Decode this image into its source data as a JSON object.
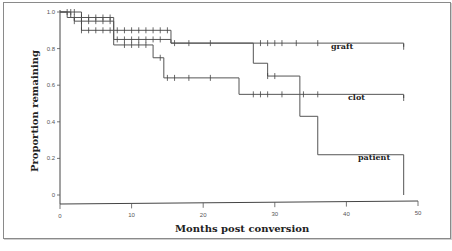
{
  "chart_data": {
    "type": "line",
    "subtype": "kaplan-meier step",
    "title": "",
    "xlabel": "Months post conversion",
    "ylabel": "Proportion remaining",
    "xlim": [
      0,
      50
    ],
    "ylim": [
      0,
      1.0
    ],
    "x_ticks": [
      "0",
      "10",
      "20",
      "30",
      "40",
      "50"
    ],
    "y_ticks": [
      "0",
      "0.2",
      "0.4",
      "0.6",
      "0.8",
      "1.0"
    ],
    "grid": false,
    "legend": "inline labels at right end of curves",
    "series": [
      {
        "name": "graft",
        "steps": [
          [
            0,
            1.0
          ],
          [
            3,
            0.97
          ],
          [
            7.5,
            0.85
          ],
          [
            15.5,
            0.83
          ],
          [
            48,
            0.81
          ]
        ],
        "censored": [
          1,
          1.5,
          2,
          3,
          4,
          5,
          6,
          7,
          8,
          9,
          10,
          11,
          12,
          13,
          14,
          16,
          18,
          21,
          28,
          29,
          30,
          31,
          33,
          36,
          48
        ]
      },
      {
        "name": "clot",
        "steps": [
          [
            0,
            1.0
          ],
          [
            1.5,
            0.97
          ],
          [
            3,
            0.9
          ],
          [
            7.5,
            0.82
          ],
          [
            13,
            0.75
          ],
          [
            14.5,
            0.64
          ],
          [
            25,
            0.55
          ],
          [
            48,
            0.53
          ]
        ],
        "censored": [
          2,
          3,
          4,
          5,
          6,
          7,
          9,
          10,
          11,
          12,
          14,
          15,
          16,
          18,
          21,
          27,
          28,
          29,
          31,
          34,
          36,
          48
        ]
      },
      {
        "name": "patient",
        "steps": [
          [
            0,
            1.0
          ],
          [
            1,
            0.97
          ],
          [
            2,
            0.95
          ],
          [
            7.5,
            0.9
          ],
          [
            15.5,
            0.83
          ],
          [
            27,
            0.72
          ],
          [
            29,
            0.65
          ],
          [
            33.5,
            0.43
          ],
          [
            36,
            0.22
          ],
          [
            48,
            0.0
          ]
        ],
        "censored": [
          2,
          3,
          4,
          5,
          6,
          7,
          8,
          9,
          10,
          11,
          12,
          13,
          14,
          15,
          29,
          30
        ]
      }
    ]
  },
  "labels": {
    "graft": "graft",
    "clot": "clot",
    "patient": "patient",
    "xlabel": "Months post conversion",
    "ylabel": "Proportion remaining"
  }
}
